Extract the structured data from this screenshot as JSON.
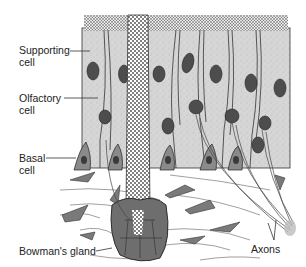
{
  "figure": {
    "colors": {
      "cell_fill": "#d4d4d4",
      "nucleus_fill": "#4a4a4a",
      "basal_fill": "#8a8a8a",
      "gland_fill": "#6e6e6e",
      "outline": "#333333",
      "background": "#ffffff"
    }
  },
  "labels": {
    "supporting_cell": [
      "Supporting",
      "cell"
    ],
    "olfactory_cell": [
      "Olfactory",
      "cell"
    ],
    "basal_cell": [
      "Basal",
      "cell"
    ],
    "bowmans_gland": "Bowman's gland",
    "axons": "Axons"
  }
}
